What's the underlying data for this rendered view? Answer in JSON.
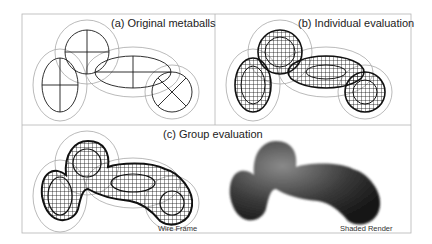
{
  "panels": {
    "a": {
      "label": "(a) Original metaballs"
    },
    "b": {
      "label": "(b) Individual evaluation"
    },
    "c": {
      "label": "(c) Group evaluation",
      "wire_caption": "Wire Frame",
      "shaded_caption": "Shaded Render"
    }
  },
  "colors": {
    "frame": "#b5b5b5",
    "outer": "#a8a8a8",
    "inner": "#1a1a1a",
    "shade_dark": "#1e1e1e",
    "shade_light": "#8a8a8a"
  }
}
